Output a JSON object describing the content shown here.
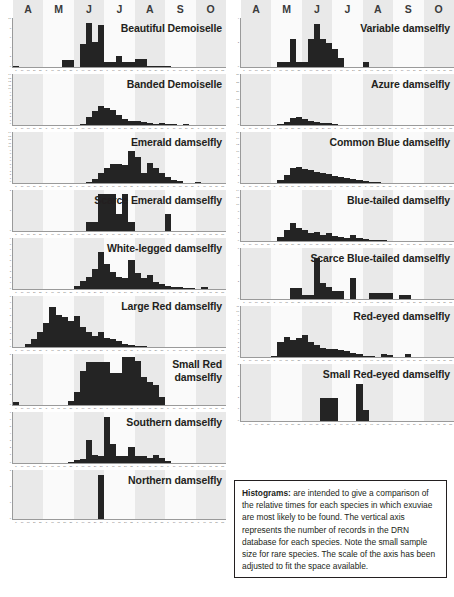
{
  "months": [
    "A",
    "M",
    "J",
    "J",
    "A",
    "S",
    "O"
  ],
  "colors": {
    "bar": "#242424",
    "band_shade": "#e9e9e9",
    "band_light": "#fafafa",
    "axis": "#9a9a9a",
    "text": "#231f20"
  },
  "caption": {
    "lead": "Histograms:",
    "body": " are intended to give a comparison of the relative times for each species in which exuviae are most likely to be found. The vertical axis represents the number of records in the DRN database for each species. Note the small sample size for rare species. The scale of the axis has been  adjusted to fit the space available."
  },
  "chart_data": {
    "type": "bar",
    "xlabel": "",
    "ylabel": "Number of records in the DRN database",
    "x_month_labels": [
      "A",
      "M",
      "J",
      "J",
      "A",
      "S",
      "O"
    ],
    "bins_per_panel": 35,
    "grid": false,
    "legend": "none",
    "panels": [
      {
        "column": "left",
        "index": 0,
        "name": "Beautiful Demoiselle",
        "label_lines": [
          "Beautiful Demoiselle"
        ],
        "ylim": [
          0,
          10
        ],
        "yticks": [
          0,
          2,
          4,
          6,
          8,
          10
        ],
        "values": [
          0.4,
          0,
          0,
          0,
          0,
          0,
          0,
          0,
          1.6,
          1.6,
          0,
          4.9,
          9.3,
          5.5,
          9.0,
          1.3,
          1.3,
          2.6,
          1.3,
          1.3,
          1.9,
          1.9,
          0.5,
          0.5,
          0.4,
          0.4,
          0,
          0,
          0,
          0,
          0,
          0,
          0,
          0,
          0
        ]
      },
      {
        "column": "left",
        "index": 1,
        "name": "Banded Demoiselle",
        "label_lines": [
          "Banded Demoiselle"
        ],
        "ylim": [
          0,
          14
        ],
        "yticks": [
          0,
          1,
          2,
          3,
          4,
          5,
          6,
          7,
          8,
          9,
          10,
          11,
          12,
          13,
          14
        ],
        "values": [
          0,
          0,
          0,
          0,
          0,
          0,
          0,
          0,
          0,
          0,
          0,
          0.6,
          2.4,
          4.2,
          5.6,
          5.0,
          4.6,
          3.2,
          2.0,
          1.5,
          1.3,
          1.1,
          0.9,
          0.7,
          0.8,
          0.6,
          0.5,
          0.4,
          0.5,
          0.3,
          0.3,
          0.2,
          0,
          0,
          0
        ]
      },
      {
        "column": "left",
        "index": 2,
        "name": "Emerald damselfly",
        "label_lines": [
          "Emerald damselfly"
        ],
        "ylim": [
          0,
          14
        ],
        "yticks": [
          0,
          1,
          2,
          3,
          4,
          5,
          6,
          7,
          8,
          9,
          10,
          11,
          12,
          13,
          14
        ],
        "values": [
          0,
          0,
          0,
          0,
          0,
          0,
          0,
          0.3,
          0,
          0.4,
          0.4,
          0.3,
          0.5,
          1.5,
          3.0,
          4.6,
          5.6,
          5.6,
          5.4,
          9.2,
          7.5,
          3.2,
          6.0,
          4.4,
          3.1,
          2.0,
          1.0,
          0.9,
          0.3,
          0.3,
          0.5,
          0.4,
          0,
          0,
          0
        ]
      },
      {
        "column": "left",
        "index": 3,
        "name": "Scarce Emerald damselfly",
        "label_lines": [
          "Scarce Emerald damselfly"
        ],
        "ylim": [
          0,
          2
        ],
        "yticks": [
          0,
          1,
          2
        ],
        "values": [
          0,
          0,
          0,
          0,
          0,
          0,
          0,
          0,
          0,
          0,
          0,
          0,
          0.5,
          0.5,
          1.9,
          1.9,
          1.9,
          0.9,
          1.9,
          0.5,
          0,
          0,
          0,
          0,
          0,
          0.9,
          0,
          0,
          0,
          0,
          0,
          0,
          0,
          0,
          0
        ]
      },
      {
        "column": "left",
        "index": 4,
        "name": "White-legged damselfly",
        "label_lines": [
          "White-legged damselfly"
        ],
        "ylim": [
          0,
          9
        ],
        "yticks": [
          0,
          1,
          2,
          3,
          4,
          5,
          6,
          7,
          8,
          9
        ],
        "values": [
          0,
          0,
          0,
          0,
          0,
          0,
          0,
          0,
          0,
          0,
          0.8,
          1.6,
          2.4,
          3.8,
          6.8,
          4.6,
          3.3,
          2.4,
          2.2,
          5.4,
          3.0,
          2.1,
          2.7,
          1.4,
          1.0,
          0.8,
          0.5,
          0.5,
          0.4,
          0.3,
          0.2,
          0.6,
          0,
          0,
          0
        ]
      },
      {
        "column": "left",
        "index": 5,
        "name": "Large Red damselfly",
        "label_lines": [
          "Large Red damselfly"
        ],
        "ylim": [
          0,
          8
        ],
        "yticks": [
          0,
          1,
          2,
          3,
          4,
          5,
          6,
          7,
          8
        ],
        "values": [
          0,
          0.2,
          0.6,
          1.5,
          2.6,
          4.0,
          6.6,
          5.3,
          4.9,
          4.4,
          5.2,
          3.4,
          2.5,
          2.0,
          2.6,
          1.6,
          1.4,
          1.1,
          0.7,
          0.5,
          0.4,
          0.3,
          0.2,
          0.1,
          0,
          0,
          0,
          0,
          0,
          0,
          0,
          0,
          0,
          0,
          0
        ]
      },
      {
        "column": "left",
        "index": 6,
        "name": "Small Red damselfly",
        "label_lines": [
          "Small Red",
          "damselfly"
        ],
        "ylim": [
          0,
          5
        ],
        "yticks": [
          0,
          1,
          2,
          3,
          4,
          5
        ],
        "values": [
          0.4,
          0,
          0,
          0,
          0,
          0,
          0,
          0,
          0,
          0.5,
          1.4,
          3.5,
          4.4,
          4.4,
          4.4,
          4.4,
          3.3,
          3.3,
          4.9,
          4.9,
          4.5,
          2.9,
          2.4,
          2.1,
          0.9,
          0,
          0,
          0,
          0,
          0,
          0,
          0,
          0,
          0,
          0
        ]
      },
      {
        "column": "left",
        "index": 7,
        "name": "Southern damselfly",
        "label_lines": [
          "Southern damselfly"
        ],
        "ylim": [
          0,
          7
        ],
        "yticks": [
          0,
          1,
          2,
          3,
          4,
          5,
          6,
          7
        ],
        "values": [
          0,
          0,
          0,
          0,
          0,
          0,
          0,
          0,
          0,
          0.3,
          0.5,
          0.7,
          3.4,
          1.3,
          1.1,
          6.6,
          2.8,
          1.1,
          1.1,
          2.4,
          1.1,
          1.1,
          0.8,
          1.3,
          0.9,
          0.4,
          0,
          0,
          0,
          0,
          0,
          0,
          0,
          0,
          0
        ]
      },
      {
        "column": "left",
        "index": 8,
        "name": "Northern damselfly",
        "label_lines": [
          "Northern damselfly"
        ],
        "ylim": [
          0,
          3
        ],
        "yticks": [
          0,
          1,
          2,
          3
        ],
        "values": [
          0,
          0,
          0,
          0,
          0,
          0,
          0,
          0,
          0,
          0,
          0,
          0,
          0,
          0,
          2.8,
          0,
          0,
          0,
          0,
          0,
          0,
          0,
          0,
          0,
          0,
          0,
          0,
          0,
          0,
          0,
          0,
          0,
          0,
          0,
          0
        ]
      },
      {
        "column": "right",
        "index": 0,
        "name": "Variable damselfly",
        "label_lines": [
          "Variable damselfly"
        ],
        "ylim": [
          0,
          4
        ],
        "yticks": [
          0,
          2,
          4
        ],
        "values": [
          0,
          0,
          0,
          0,
          0,
          0,
          0.5,
          0.5,
          2.4,
          0.5,
          0.5,
          2.4,
          3.7,
          2.4,
          2.1,
          1.6,
          0.8,
          0,
          0,
          0,
          0.5,
          0,
          0,
          0,
          0,
          0,
          0,
          0,
          0,
          0,
          0,
          0,
          0,
          0,
          0
        ]
      },
      {
        "column": "right",
        "index": 1,
        "name": "Azure damselfly",
        "label_lines": [
          "Azure damselfly"
        ],
        "ylim": [
          0,
          30
        ],
        "yticks": [
          0,
          5,
          10,
          15,
          20,
          25,
          30
        ],
        "values": [
          0,
          0,
          0,
          0,
          0,
          0.3,
          1.0,
          2.5,
          4.8,
          5.4,
          4.3,
          3.2,
          2.6,
          2.0,
          1.6,
          1.2,
          0.9,
          0.7,
          0.6,
          0.5,
          0.4,
          0.3,
          0.2,
          0.2,
          0.1,
          0.1,
          0,
          0,
          0,
          0,
          0,
          0,
          0,
          0,
          0
        ]
      },
      {
        "column": "right",
        "index": 2,
        "name": "Common Blue damselfly",
        "label_lines": [
          "Common Blue damselfly"
        ],
        "ylim": [
          0,
          16
        ],
        "yticks": [
          0,
          2,
          4,
          6,
          8,
          10,
          12,
          14,
          16
        ],
        "values": [
          0,
          0,
          0,
          0,
          0,
          0.3,
          1.2,
          3.0,
          5.0,
          5.6,
          4.8,
          4.4,
          4.0,
          3.6,
          3.1,
          2.6,
          2.3,
          2.0,
          1.6,
          1.3,
          0.9,
          0.6,
          0.5,
          0.4,
          0.3,
          0.3,
          0.2,
          0.2,
          0.2,
          0.1,
          0.1,
          0,
          0,
          0,
          0
        ]
      },
      {
        "column": "right",
        "index": 3,
        "name": "Blue-tailed damselfly",
        "label_lines": [
          "Blue-tailed damselfly"
        ],
        "ylim": [
          0,
          14
        ],
        "yticks": [
          0,
          2,
          4,
          6,
          8,
          10,
          12,
          14
        ],
        "values": [
          0,
          0,
          0,
          0,
          0,
          0.4,
          1.4,
          3.4,
          5.2,
          4.0,
          3.4,
          2.4,
          2.9,
          1.9,
          2.6,
          1.6,
          1.3,
          1.1,
          1.9,
          1.0,
          0.8,
          0.7,
          0.6,
          0.5,
          0.4,
          0.4,
          0.3,
          0.2,
          0.2,
          0.2,
          0.1,
          0.1,
          0,
          0,
          0
        ]
      },
      {
        "column": "right",
        "index": 4,
        "name": "Scarce Blue-tailed damselfly",
        "label_lines": [
          "Scarce Blue-tailed damselfly"
        ],
        "ylim": [
          0,
          6
        ],
        "yticks": [
          0,
          2,
          4,
          6
        ],
        "values": [
          0,
          0,
          0,
          0,
          0,
          0,
          0,
          0,
          1.4,
          1.4,
          0.6,
          0.6,
          5.1,
          2.1,
          1.6,
          1.1,
          1.1,
          0,
          2.6,
          0,
          0,
          0.9,
          0.9,
          0.9,
          0.9,
          0,
          0.6,
          0.6,
          0,
          0,
          0,
          0,
          0,
          0,
          0
        ]
      },
      {
        "column": "right",
        "index": 5,
        "name": "Red-eyed damselfly",
        "label_lines": [
          "Red-eyed damselfly"
        ],
        "ylim": [
          0,
          11
        ],
        "yticks": [
          0,
          1,
          2,
          3,
          4,
          5,
          6,
          7,
          8,
          9,
          10,
          11
        ],
        "values": [
          0,
          0,
          0,
          0,
          0,
          0.4,
          3.6,
          4.7,
          4.0,
          4.4,
          5.1,
          3.5,
          2.9,
          2.3,
          2.0,
          1.9,
          1.7,
          1.5,
          1.2,
          0.8,
          0.5,
          0.4,
          0.3,
          0.9,
          0.7,
          0.3,
          0.3,
          0.8,
          0.3,
          0,
          0,
          0,
          0,
          0,
          0
        ]
      },
      {
        "column": "right",
        "index": 6,
        "name": "Small Red-eyed damselfly",
        "label_lines": [
          "Small Red-eyed damselfly"
        ],
        "ylim": [
          0,
          5
        ],
        "yticks": [
          0,
          1,
          2,
          3,
          4,
          5
        ],
        "values": [
          0,
          0,
          0,
          0,
          0,
          0,
          0,
          0,
          0,
          0,
          0,
          0,
          0,
          2.1,
          2.1,
          2.1,
          0,
          0,
          0,
          3.4,
          1.1,
          0,
          0,
          0,
          0,
          0,
          0,
          0,
          0,
          0,
          0,
          0,
          0,
          0,
          0
        ]
      }
    ]
  }
}
